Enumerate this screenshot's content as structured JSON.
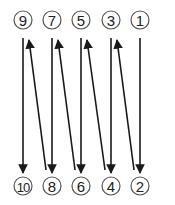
{
  "diagram": {
    "type": "zigzag-order",
    "colors": {
      "line": "#1a1a1a",
      "circle_stroke": "#555555",
      "text": "#222222",
      "background": "#ffffff"
    },
    "top_row": [
      {
        "label": "9",
        "x": 23
      },
      {
        "label": "7",
        "x": 52
      },
      {
        "label": "5",
        "x": 81
      },
      {
        "label": "3",
        "x": 111
      },
      {
        "label": "1",
        "x": 140
      }
    ],
    "bottom_row": [
      {
        "label": "10",
        "x": 23
      },
      {
        "label": "8",
        "x": 52
      },
      {
        "label": "6",
        "x": 81
      },
      {
        "label": "4",
        "x": 111
      },
      {
        "label": "2",
        "x": 140
      }
    ],
    "flow": [
      "1→2",
      "2→3",
      "3→4",
      "4→5",
      "5→6",
      "6→7",
      "7→8",
      "8→9",
      "9→10"
    ]
  }
}
